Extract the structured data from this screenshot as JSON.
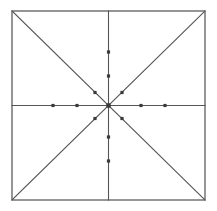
{
  "canvas": {
    "width": 217,
    "height": 211,
    "background_color": "#ffffff",
    "title": "Square with diagonals, medians and tick-marked rays"
  },
  "style": {
    "line_color": "#555555",
    "border_color": "#6a6a6a",
    "dot_color": "#3a3a3a",
    "line_width": 1.1,
    "border_width": 1.4,
    "dot_size": 3.2
  },
  "figure": {
    "square": {
      "label": "outer-square",
      "left": 12,
      "top": 11,
      "right": 205,
      "bottom": 200
    },
    "center": {
      "label": "center-point",
      "x": 108.5,
      "y": 105.5
    },
    "diagonals": [
      {
        "name": "diagonal-tl-br",
        "x1": 12,
        "y1": 11,
        "x2": 205,
        "y2": 200
      },
      {
        "name": "diagonal-bl-tr",
        "x1": 12,
        "y1": 200,
        "x2": 205,
        "y2": 11
      }
    ],
    "medians": [
      {
        "name": "vertical-median",
        "x1": 108.5,
        "y1": 11,
        "x2": 108.5,
        "y2": 200
      },
      {
        "name": "horizontal-median",
        "x1": 12,
        "y1": 105.5,
        "x2": 205,
        "y2": 105.5
      }
    ],
    "rays": [
      {
        "name": "ray-north",
        "angle_deg": 90,
        "dot_count": 2
      },
      {
        "name": "ray-northeast",
        "angle_deg": 45,
        "dot_count": 1
      },
      {
        "name": "ray-east",
        "angle_deg": 0,
        "dot_count": 2
      },
      {
        "name": "ray-southeast",
        "angle_deg": -45,
        "dot_count": 1
      },
      {
        "name": "ray-south",
        "angle_deg": -90,
        "dot_count": 2
      },
      {
        "name": "ray-southwest",
        "angle_deg": -135,
        "dot_count": 1
      },
      {
        "name": "ray-west",
        "angle_deg": 180,
        "dot_count": 2
      },
      {
        "name": "ray-northwest",
        "angle_deg": 135,
        "dot_count": 1
      }
    ],
    "dots": [
      {
        "name": "dot-west-outer",
        "x": 53,
        "y": 105.5,
        "ray": "ray-west"
      },
      {
        "name": "dot-west-inner",
        "x": 77,
        "y": 105.5,
        "ray": "ray-west"
      },
      {
        "name": "dot-east-inner",
        "x": 141,
        "y": 105.5,
        "ray": "ray-east"
      },
      {
        "name": "dot-east-outer",
        "x": 165,
        "y": 105.5,
        "ray": "ray-east"
      },
      {
        "name": "dot-north-outer",
        "x": 108.5,
        "y": 52,
        "ray": "ray-north"
      },
      {
        "name": "dot-north-inner",
        "x": 108.5,
        "y": 76,
        "ray": "ray-north"
      },
      {
        "name": "dot-south-inner",
        "x": 108.5,
        "y": 137,
        "ray": "ray-south"
      },
      {
        "name": "dot-south-outer",
        "x": 108.5,
        "y": 161,
        "ray": "ray-south"
      },
      {
        "name": "dot-northwest",
        "x": 95,
        "y": 92.5,
        "ray": "ray-northwest"
      },
      {
        "name": "dot-northeast",
        "x": 122,
        "y": 92.5,
        "ray": "ray-northeast"
      },
      {
        "name": "dot-southwest",
        "x": 95,
        "y": 118.5,
        "ray": "ray-southwest"
      },
      {
        "name": "dot-southeast",
        "x": 122,
        "y": 118.5,
        "ray": "ray-southeast"
      }
    ]
  }
}
